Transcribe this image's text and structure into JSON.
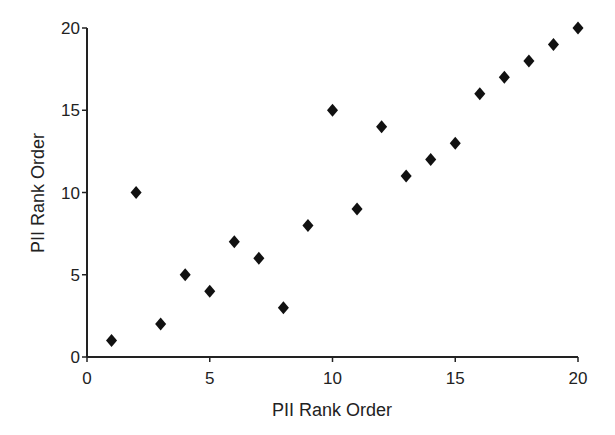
{
  "chart_data": {
    "type": "scatter",
    "title": "",
    "xlabel": "PII Rank Order",
    "ylabel": "PII Rank Order",
    "xlim": [
      0,
      20
    ],
    "ylim": [
      0,
      20
    ],
    "x_ticks": [
      0,
      5,
      10,
      15,
      20
    ],
    "y_ticks": [
      0,
      5,
      10,
      15,
      20
    ],
    "grid": false,
    "legend": null,
    "marker": "diamond",
    "marker_color": "#111111",
    "series": [
      {
        "name": "PII Rank Order",
        "x": [
          1,
          2,
          3,
          4,
          5,
          6,
          7,
          8,
          9,
          10,
          11,
          12,
          13,
          14,
          15,
          16,
          17,
          18,
          19,
          20
        ],
        "y": [
          1,
          10,
          2,
          5,
          4,
          7,
          6,
          3,
          8,
          15,
          9,
          14,
          11,
          12,
          13,
          16,
          17,
          18,
          19,
          20
        ]
      }
    ]
  }
}
